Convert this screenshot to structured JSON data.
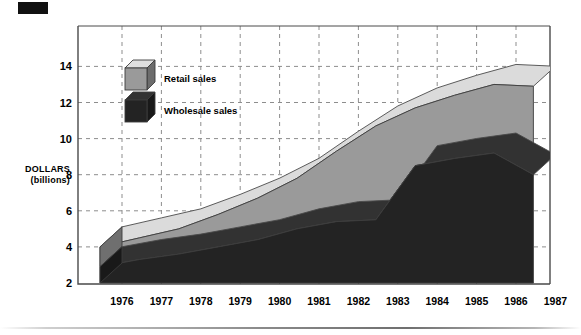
{
  "figure": {
    "corner_mark": "black-block",
    "axis_label_line1": "DOLLARS",
    "axis_label_line2": "(billions)"
  },
  "legend": {
    "items": [
      {
        "label": "Retail sales",
        "color": "#9a9a9a",
        "icon": "cube-icon"
      },
      {
        "label": "Wholesale sales",
        "color": "#232323",
        "icon": "cube-icon"
      }
    ]
  },
  "chart_data": {
    "type": "area",
    "title": "",
    "subtitle": "",
    "xlabel": "",
    "ylabel": "DOLLARS (billions)",
    "stacked": false,
    "grid": true,
    "legend_position": "inside-upper-left",
    "ylim": [
      2,
      15
    ],
    "yticks": [
      2,
      4,
      6,
      8,
      10,
      12,
      14
    ],
    "ytick_labels": [
      "2",
      "4",
      "6",
      "8",
      "10",
      "12",
      "14"
    ],
    "categories": [
      "1976",
      "1977",
      "1978",
      "1979",
      "1980",
      "1981",
      "1982",
      "1983",
      "1984",
      "1985",
      "1986",
      "1987"
    ],
    "x": [
      "1976",
      "1977",
      "1978",
      "1979",
      "1980",
      "1981",
      "1982",
      "1983",
      "1984",
      "1985",
      "1986",
      "1987"
    ],
    "series": [
      {
        "name": "Retail sales",
        "color": "#9a9a9a",
        "values": [
          4.0,
          4.5,
          5.0,
          5.8,
          6.7,
          7.8,
          9.3,
          10.7,
          11.7,
          12.4,
          13.0,
          12.9
        ]
      },
      {
        "name": "Wholesale sales",
        "color": "#232323",
        "values": [
          2.9,
          3.3,
          3.6,
          4.0,
          4.4,
          5.0,
          5.4,
          5.5,
          8.5,
          8.9,
          9.2,
          8.0
        ]
      }
    ]
  }
}
